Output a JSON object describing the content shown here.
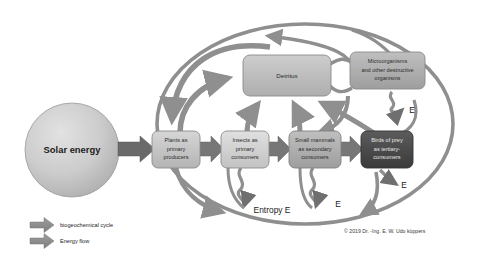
{
  "diagram": {
    "source": {
      "solar": "Solar energy"
    },
    "nodes": [
      {
        "id": "plants",
        "label_line1": "Plants as",
        "label_line2": "primary",
        "label_line3": "producers"
      },
      {
        "id": "insects",
        "label_line1": "Insects as",
        "label_line2": "primary",
        "label_line3": "consumers"
      },
      {
        "id": "mammals",
        "label_line1": "Small mammals",
        "label_line2": "as secondary",
        "label_line3": "consumers"
      },
      {
        "id": "birds",
        "label_line1": "Birds of prey",
        "label_line2": "as tertiary-",
        "label_line3": "consumers"
      }
    ],
    "detritus": {
      "label": "Detritus"
    },
    "microorganisms": {
      "line1": "Microorganisms",
      "line2": "and other destructive",
      "line3": "organisms"
    },
    "entropy": {
      "main_label": "Entropy E",
      "short_label_1": "E",
      "short_label_2": "E",
      "short_label_3": "E"
    },
    "legend": {
      "items": [
        {
          "key": "biogeochemical",
          "label": "biogeochemical cycle",
          "color": "#8c8c8c"
        },
        {
          "key": "energy_flow",
          "label": "Energy flow",
          "color": "#8c8c8c"
        }
      ]
    },
    "copyright": "© 2019 Dr. -Ing. E. W. Udo küppers",
    "colors": {
      "arrow_gray": "#8f8f8f",
      "arrow_dark": "#6e6e6e",
      "box_light": "#c9c9c9",
      "box_mid": "#b3b3b3",
      "box_dark": "#4a4a4a",
      "detritus_fill": "#bdbdbd",
      "micro_fill": "#b8b8b8",
      "circle_fill": "#c2c2c2",
      "ellipse_stroke": "#8c8c8c",
      "text_dark": "#2b2b2b",
      "text_light": "#e8e8e8"
    }
  }
}
